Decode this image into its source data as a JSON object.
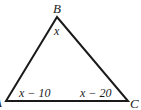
{
  "diagram": {
    "type": "triangle",
    "vertices": {
      "A": {
        "label": "A",
        "x": 6,
        "y": 101
      },
      "B": {
        "label": "B",
        "x": 57,
        "y": 17
      },
      "C": {
        "label": "C",
        "x": 128,
        "y": 101
      }
    },
    "angles": {
      "B": "x",
      "A": "x − 10",
      "C": "x − 20"
    },
    "stroke_color": "#1a1a1a"
  }
}
